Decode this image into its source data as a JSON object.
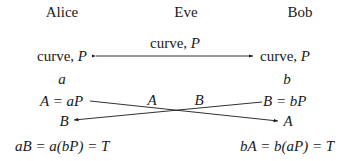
{
  "parties": {
    "alice": "Alice",
    "eve": "Eve",
    "bob": "Bob"
  },
  "public_channel": {
    "label_text": "curve, ",
    "label_var": "P"
  },
  "alice": {
    "curve_text": "curve, ",
    "curve_var": "P",
    "secret": "a",
    "public_key": "A = aP",
    "received": "B",
    "shared": "aB = a(bP) = T"
  },
  "bob": {
    "curve_text": "curve, ",
    "curve_var": "P",
    "secret": "b",
    "public_key": "B = bP",
    "received": "A",
    "shared": "bA = b(aP) = T"
  },
  "exchange": {
    "label_a": "A",
    "label_b": "B"
  }
}
